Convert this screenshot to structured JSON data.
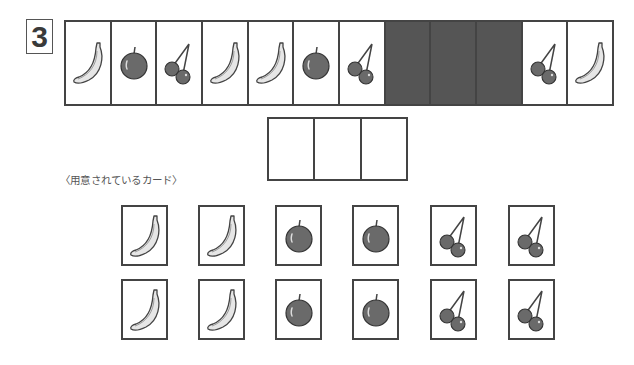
{
  "question": {
    "number": "3"
  },
  "sequence": {
    "cells": [
      {
        "fruit": "banana",
        "hidden": false
      },
      {
        "fruit": "apple",
        "hidden": false
      },
      {
        "fruit": "cherry",
        "hidden": false
      },
      {
        "fruit": "banana",
        "hidden": false
      },
      {
        "fruit": "banana",
        "hidden": false
      },
      {
        "fruit": "apple",
        "hidden": false
      },
      {
        "fruit": "cherry",
        "hidden": false
      },
      {
        "fruit": null,
        "hidden": true
      },
      {
        "fruit": null,
        "hidden": true
      },
      {
        "fruit": null,
        "hidden": true
      },
      {
        "fruit": "cherry",
        "hidden": false
      },
      {
        "fruit": "banana",
        "hidden": false
      }
    ]
  },
  "answer_slots": {
    "count": 3
  },
  "available_cards": {
    "label": "〈用意されているカード〉",
    "rows": [
      [
        "banana",
        "banana",
        "apple",
        "apple",
        "cherry",
        "cherry"
      ],
      [
        "banana",
        "banana",
        "apple",
        "apple",
        "cherry",
        "cherry"
      ]
    ]
  },
  "colors": {
    "border": "#444444",
    "hidden_fill": "#555555",
    "fruit_dark": "#6a6a6a",
    "banana_fill": "#e6e6e6"
  }
}
